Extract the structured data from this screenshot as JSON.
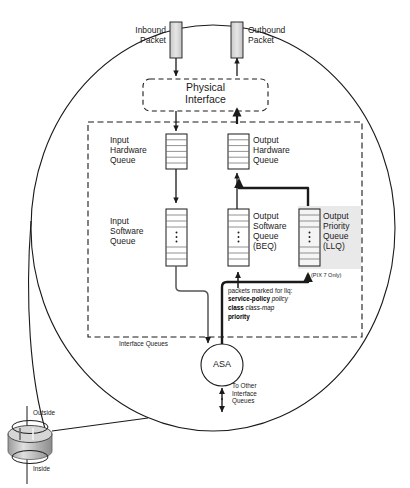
{
  "diagram": {
    "title_hidden": "",
    "packets": {
      "inbound_label": "Inbound\nPacket",
      "outbound_label": "Outbound\nPacket"
    },
    "physical_interface": {
      "label": "Physical\nInterface"
    },
    "interface_queues": {
      "box_label": "Interface Queues",
      "queues": [
        {
          "name": "input-hardware-queue",
          "label": "Input\nHardware\nQueue",
          "cells": 6,
          "has_ellipsis": false,
          "highlighted": false
        },
        {
          "name": "output-hardware-queue",
          "label": "Output\nHardware\nQueue",
          "cells": 6,
          "has_ellipsis": false,
          "highlighted": false
        },
        {
          "name": "input-software-queue",
          "label": "Input\nSoftware\nQueue",
          "cells": 6,
          "has_ellipsis": true,
          "highlighted": false
        },
        {
          "name": "output-software-queue",
          "label": "Output\nSoftware\nQueue\n(BEQ)",
          "cells": 6,
          "has_ellipsis": true,
          "highlighted": false
        },
        {
          "name": "output-priority-queue",
          "label": "Output\nPriority\nQueue\n(LLQ)",
          "cells": 6,
          "has_ellipsis": true,
          "highlighted": true
        }
      ]
    },
    "annotations": {
      "pix_note": "(PIX 7 Only)",
      "llq_note_heading": "packets marked for llq:",
      "llq_note_lines": [
        {
          "bold": "service-policy",
          "italic": "policy"
        },
        {
          "bold": "class",
          "italic": "class-map"
        },
        {
          "bold": "priority",
          "italic": ""
        }
      ]
    },
    "asa": {
      "label": "ASA",
      "other_queues_label": "To Other\nInterface\nQueues"
    },
    "interface_icon": {
      "outside_label": "Outside",
      "inside_label": "Inside"
    },
    "colors": {
      "stroke": "#1a1a1a",
      "packet_fill": "#d4d4d4",
      "queue_fill": "#ffffff",
      "highlight_fill": "#e8e8e8",
      "cylinder_fill": "#b8b8b8"
    }
  }
}
